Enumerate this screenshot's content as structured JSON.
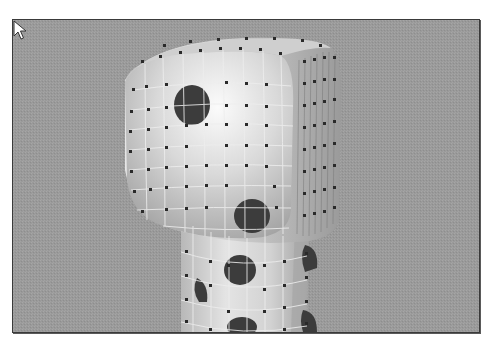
{
  "viewport": {
    "label": "3D modeling viewport",
    "background_color": "#9a9a9a",
    "border_color": "#3a3a3a"
  },
  "model": {
    "description": "Subdivision-surface character head and neck with polka-dot texture and control cage",
    "surface_color": "#d8d8d8",
    "highlight_color": "#f4f4f4",
    "spot_color": "#3c3c3c",
    "control_point_color": "#2a2a2a",
    "grid_line_color": "#ececec"
  },
  "cursor": {
    "type": "arrow-pointer"
  }
}
